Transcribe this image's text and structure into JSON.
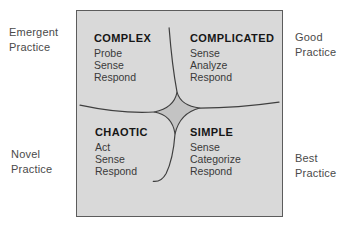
{
  "diagram": {
    "name": "Cynefin framework",
    "type": "quadrant-diagram"
  },
  "colors": {
    "page_bg": "#ffffff",
    "box_bg": "#d9d9d9",
    "box_border": "#5c5c5c",
    "center_star_fill": "#c3c3c3",
    "curve_stroke": "#3f3f3f",
    "heading_color": "#161616",
    "step_color": "#3a3a3a",
    "outer_label_color": "#4a4a4a"
  },
  "outer_labels": {
    "top_left": {
      "line1": "Emergent",
      "line2": "Practice"
    },
    "top_right": {
      "line1": "Good",
      "line2": "Practice"
    },
    "bottom_left": {
      "line1": "Novel",
      "line2": "Practice"
    },
    "bottom_right": {
      "line1": "Best",
      "line2": "Practice"
    }
  },
  "quadrants": [
    {
      "id": "complex",
      "title": "COMPLEX",
      "steps": [
        "Probe",
        "Sense",
        "Respond"
      ]
    },
    {
      "id": "complicated",
      "title": "COMPLICATED",
      "steps": [
        "Sense",
        "Analyze",
        "Respond"
      ]
    },
    {
      "id": "chaotic",
      "title": "CHAOTIC",
      "steps": [
        "Act",
        "Sense",
        "Respond"
      ]
    },
    {
      "id": "simple",
      "title": "SIMPLE",
      "steps": [
        "Sense",
        "Categorize",
        "Respond"
      ]
    }
  ]
}
